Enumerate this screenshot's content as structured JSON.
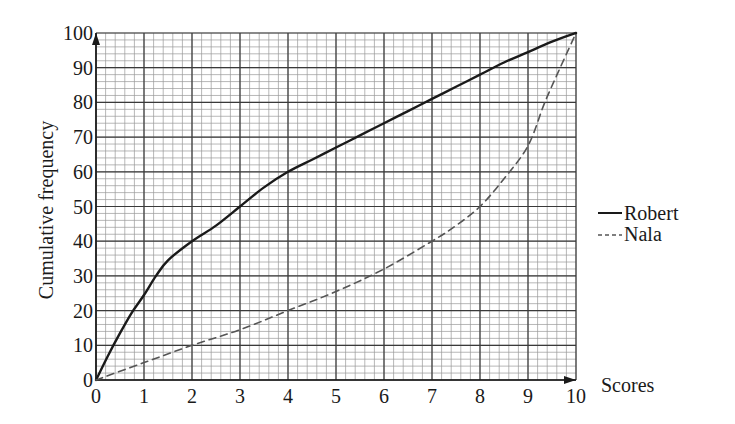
{
  "chart_data": {
    "type": "line",
    "title": "",
    "xlabel": "Scores",
    "ylabel": "Cumulative frequency",
    "xlim": [
      0,
      10
    ],
    "ylim": [
      0,
      100
    ],
    "x_ticks": [
      0,
      1,
      2,
      3,
      4,
      5,
      6,
      7,
      8,
      9,
      10
    ],
    "y_ticks": [
      0,
      10,
      20,
      30,
      40,
      50,
      60,
      70,
      80,
      90,
      100
    ],
    "grid": true,
    "grid_minor_subdivisions": 5,
    "legend_position": "right",
    "series": [
      {
        "name": "Robert",
        "style": "solid",
        "x": [
          0,
          0.25,
          0.5,
          0.75,
          1,
          1.25,
          1.5,
          2,
          2.5,
          3,
          3.5,
          4,
          4.5,
          5,
          5.5,
          6,
          6.5,
          7,
          7.5,
          8,
          8.5,
          9,
          9.5,
          10
        ],
        "values": [
          0,
          7,
          13.5,
          19.5,
          24.5,
          30,
          34.5,
          40,
          44.5,
          50,
          55.5,
          60,
          63.5,
          67,
          70.5,
          74,
          77.5,
          81,
          84.5,
          88,
          91.5,
          94.5,
          97.5,
          100
        ]
      },
      {
        "name": "Nala",
        "style": "dashed",
        "x": [
          0,
          1,
          2,
          3,
          4,
          5,
          6,
          7,
          7.5,
          8,
          8.5,
          9,
          9.35,
          9.67,
          10
        ],
        "values": [
          0,
          5,
          10,
          14.5,
          20,
          25.5,
          32,
          40,
          44.5,
          50,
          58,
          67.5,
          80,
          90,
          100
        ]
      }
    ]
  },
  "legend": {
    "items": [
      {
        "label": "Robert",
        "marker": "—"
      },
      {
        "label": "Nala",
        "marker": "---"
      }
    ]
  },
  "colors": {
    "line": "#1a1a1a",
    "dashed_line": "#555555",
    "major_grid": "#3a3a3a",
    "minor_grid": "#9a9a9a",
    "background": "#ffffff"
  }
}
